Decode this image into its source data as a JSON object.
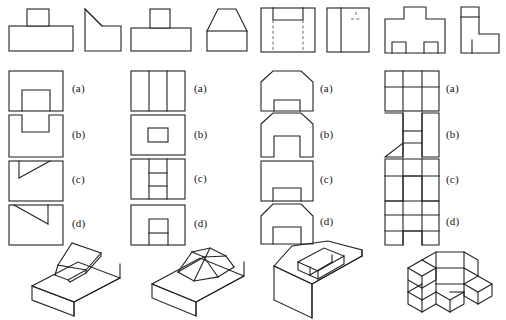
{
  "page": {
    "option_labels": [
      "(a)",
      "(b)",
      "(c)",
      "(d)"
    ],
    "line_colors": {
      "visible": "#222222",
      "hidden": "#6a6a6a",
      "background": "#ffffff"
    }
  },
  "problems": [
    {
      "id": "problem-1",
      "given_views": [
        {
          "name": "front-view",
          "description": "Rectangular base with a small rectangular boss centred on top"
        },
        {
          "name": "side-view",
          "description": "Rectangle with a triangular chamfer cut from the upper left corner"
        }
      ],
      "options": [
        {
          "label": "(a)",
          "description": "Rectangle containing an inverted-U rectangle sitting on the bottom edge"
        },
        {
          "label": "(b)",
          "description": "Rectangle with a rectangular notch open at the top edge"
        },
        {
          "label": "(c)",
          "description": "Rectangle with a short vertical then a diagonal rising to the top edge at upper left"
        },
        {
          "label": "(d)",
          "description": "Rectangle with a diagonal falling from the top left to a short vertical returning to the top edge"
        }
      ],
      "isometric": {
        "name": "isometric-box-with-raised-flap",
        "description": "Rectangular block with an inclined flat plate raised out of a slot in the top face"
      }
    },
    {
      "id": "problem-2",
      "given_views": [
        {
          "name": "front-view",
          "description": "Rectangular base with a small rectangular boss centred on top"
        },
        {
          "name": "side-view",
          "description": "Rectangle topped by a trapezoid with sloping sides"
        }
      ],
      "options": [
        {
          "label": "(a)",
          "description": "Rectangle divided by two vertical lines into three panels"
        },
        {
          "label": "(b)",
          "description": "Rectangle with a small rectangle floating in the centre"
        },
        {
          "label": "(c)",
          "description": "Rectangle with two vertical lines and two horizontal lines crossing the middle panel"
        },
        {
          "label": "(d)",
          "description": "Rectangle with a small rectangle on the bottom edge crossed by a horizontal line"
        }
      ],
      "isometric": {
        "name": "isometric-box-with-wedge",
        "description": "Rectangular block with a tapering wedge ramp rising from its top face"
      }
    },
    {
      "id": "problem-3",
      "given_views": [
        {
          "name": "front-view",
          "description": "Square with a rectangular slot open at the top and two vertical hidden lines running to the bottom"
        },
        {
          "name": "side-view",
          "description": "Square divided by a vertical line with short hidden lines near the top right"
        }
      ],
      "options": [
        {
          "label": "(a)",
          "description": "Chamfered house shape with a wide rectangular notch on the bottom edge"
        },
        {
          "label": "(b)",
          "description": "Chamfered house shape with a tall rectangular notch on the bottom edge"
        },
        {
          "label": "(c)",
          "description": "Plain rectangle with a rectangular notch on the bottom edge"
        },
        {
          "label": "(d)",
          "description": "Chamfered house shape containing a rectangle resting on the bottom edge"
        }
      ],
      "isometric": {
        "name": "isometric-block-with-stepped-pocket",
        "description": "Chamfered block with a rectangular pocket recessed into the top face"
      }
    },
    {
      "id": "problem-4",
      "given_views": [
        {
          "name": "front-view",
          "description": "Cross / plus shaped outline with two small squares on the bottom edge"
        },
        {
          "name": "side-view",
          "description": "L-shaped outline with a horizontal line near the top and a short vertical tick"
        }
      ],
      "options": [
        {
          "label": "(a)",
          "description": "Rectangle split into a three-by-two grid of cells"
        },
        {
          "label": "(b)",
          "description": "U-shaped outline with a horizontal bar joining the two legs"
        },
        {
          "label": "(c)",
          "description": "U-shaped outline with a horizontal line near the top spanning the full width"
        },
        {
          "label": "(d)",
          "description": "Grid of cells with a rectangular notch removed from the bottom centre"
        }
      ],
      "isometric": {
        "name": "isometric-stepped-cross-block",
        "description": "Cross shaped block built from stepped cubic blocks at different levels"
      }
    }
  ]
}
